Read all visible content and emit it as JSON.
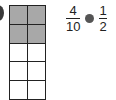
{
  "grid": {
    "columns": 2,
    "rows": 5,
    "shaded_cells": 4,
    "total_cells": 10,
    "shade_color": "#a8a8a8"
  },
  "comparison": {
    "left": {
      "numerator": "4",
      "denominator": "10"
    },
    "symbol": "blank-circle",
    "right": {
      "numerator": "1",
      "denominator": "2"
    }
  }
}
